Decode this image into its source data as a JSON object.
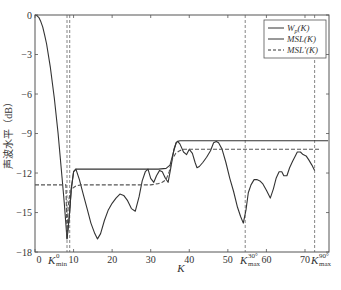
{
  "chart_data": {
    "type": "line",
    "title": "",
    "xlabel": "K",
    "ylabel": "声波水平（dB）",
    "xlim": [
      0,
      76
    ],
    "ylim": [
      -18,
      0
    ],
    "x_ticks": [
      0,
      10,
      20,
      30,
      40,
      50,
      60,
      70
    ],
    "y_ticks": [
      0,
      -3,
      -6,
      -9,
      -12,
      -15,
      -18
    ],
    "grid": false,
    "legend_position": "upper right",
    "legend": [
      "W_p(K)",
      "MSL(K)",
      "MSL'(K)"
    ],
    "annotations": [
      {
        "label": "K_min^0",
        "x": 8.3
      },
      {
        "label": "K_max^30°",
        "x": 54.5
      },
      {
        "label": "K_max^90°",
        "x": 72.5
      }
    ],
    "vlines": [
      8.3,
      9.0,
      54.5,
      72.5
    ],
    "series": [
      {
        "name": "MSL(K) curve",
        "style": "solid",
        "x": [
          0,
          0.5,
          1,
          1.5,
          2,
          2.5,
          3,
          4,
          5,
          6,
          7,
          7.6,
          8.3,
          8.9,
          9.4,
          10,
          10.6,
          11.5,
          12.5,
          13.5,
          14.5,
          15.5,
          16.2,
          17,
          18,
          19,
          20,
          21,
          22,
          23,
          24,
          25,
          26,
          27,
          27.8,
          28.6,
          29.3,
          30,
          30.8,
          31.5,
          32.3,
          33,
          33.8,
          34.5,
          35.2,
          36,
          36.6,
          37,
          37.6,
          38.5,
          39.3,
          40,
          40.8,
          41.5,
          42,
          42.6,
          43.5,
          44.5,
          45.5,
          46.3,
          47,
          47.6,
          48.5,
          49.5,
          50.5,
          51.5,
          52.5,
          53.3,
          54,
          54.7,
          55.3,
          56,
          56.8,
          57.5,
          58.3,
          59,
          60,
          61,
          61.8,
          62.5,
          63.3,
          64,
          64.5,
          65.3,
          66,
          66.8,
          67.5,
          68,
          68.8,
          69.5,
          70.3,
          71,
          71.8,
          72.5
        ],
        "y": [
          0,
          -0.05,
          -0.2,
          -0.5,
          -0.9,
          -1.5,
          -2.2,
          -4,
          -6.3,
          -9,
          -12.3,
          -14.3,
          -17,
          -15.3,
          -13.2,
          -11.9,
          -11.7,
          -12.5,
          -13.6,
          -14.7,
          -15.8,
          -16.6,
          -17,
          -16.6,
          -15.6,
          -14.8,
          -14.3,
          -13.9,
          -13.6,
          -13.7,
          -14.1,
          -14.7,
          -14.9,
          -13.8,
          -12.6,
          -11.9,
          -11.7,
          -12.4,
          -12.7,
          -12.2,
          -11.8,
          -11.9,
          -12.4,
          -12.7,
          -11.6,
          -10.2,
          -9.7,
          -9.6,
          -9.8,
          -10.4,
          -10.6,
          -10.2,
          -10.5,
          -11.2,
          -11.6,
          -11.5,
          -11.2,
          -10.8,
          -10.3,
          -9.7,
          -9.6,
          -9.7,
          -10.2,
          -11.2,
          -12.4,
          -13.4,
          -14.6,
          -15.3,
          -15.8,
          -14.8,
          -13.5,
          -12.9,
          -12.5,
          -12.5,
          -12.6,
          -12.8,
          -13.3,
          -13.9,
          -13.2,
          -12.4,
          -11.9,
          -11.9,
          -12.2,
          -12.2,
          -11.6,
          -11.1,
          -10.7,
          -10.4,
          -10.4,
          -10.6,
          -10.7,
          -11,
          -11.4,
          -11.8
        ]
      },
      {
        "name": "MSL(K) envelope",
        "style": "solid",
        "x": [
          8.3,
          8.9,
          9.4,
          10,
          10.6,
          30,
          32,
          34,
          35,
          36,
          36.6,
          37,
          37.6,
          76
        ],
        "y": [
          -17,
          -15.3,
          -13.2,
          -11.9,
          -11.7,
          -11.7,
          -11.7,
          -11.65,
          -11.4,
          -10.3,
          -9.7,
          -9.6,
          -9.55,
          -9.55
        ]
      },
      {
        "name": "MSL'(K)",
        "style": "dashed",
        "x": [
          0,
          8,
          8.3,
          8.6,
          9,
          9.5,
          10,
          10.5,
          11,
          12,
          20,
          30,
          32,
          33,
          34,
          34.8,
          35.5,
          36.5,
          37.5,
          38.5,
          40,
          50,
          60,
          70,
          74
        ],
        "y": [
          -12.9,
          -12.9,
          -16.6,
          -14.5,
          -13.6,
          -13.2,
          -13.1,
          -13,
          -12.95,
          -12.9,
          -12.9,
          -12.9,
          -12.8,
          -12.7,
          -12.5,
          -11.9,
          -11,
          -10.5,
          -10.3,
          -10.2,
          -10.2,
          -10.2,
          -10.2,
          -10.2,
          -10.2
        ]
      }
    ]
  },
  "legend": {
    "items": [
      {
        "main": "W",
        "sub": "p",
        "rest": "(K)",
        "style": "solid"
      },
      {
        "main": "MSL",
        "sub": "",
        "rest": "(K)",
        "style": "solid"
      },
      {
        "main": "MSL'",
        "sub": "",
        "rest": "(K)",
        "style": "dashed"
      }
    ]
  },
  "axis": {
    "xlabel": "K",
    "ylabel": "声波水平（dB）",
    "kmin_label": {
      "main": "K",
      "sup": "0",
      "sub": "min"
    },
    "k30_label": {
      "main": "K",
      "sup": "30°",
      "sub": "max"
    },
    "k90_label": {
      "main": "K",
      "sup": "90°",
      "sub": "max"
    }
  }
}
